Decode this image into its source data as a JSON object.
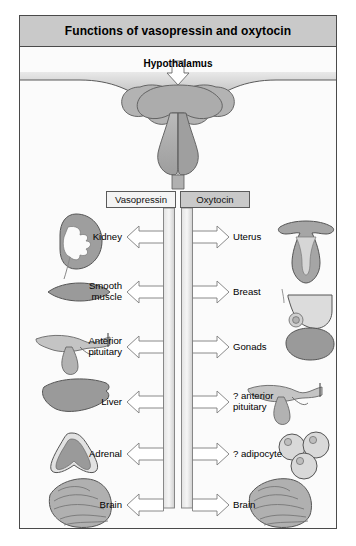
{
  "figure": {
    "title": "Functions of vasopressin and oxytocin",
    "source_label": "Hypothalamus"
  },
  "columns": {
    "left": {
      "header": "Vasopressin"
    },
    "right": {
      "header": "Oxytocin"
    }
  },
  "rows": [
    {
      "left_label": "Kidney",
      "right_label": "Uterus",
      "left_icon": "kidney-icon",
      "right_icon": "uterus-icon"
    },
    {
      "left_label": "Smooth\nmuscle",
      "left_label_line1": "Smooth",
      "left_label_line2": "muscle",
      "right_label": "Breast",
      "left_icon": "smooth-muscle-icon",
      "right_icon": "breast-icon"
    },
    {
      "left_label_line1": "Anterior",
      "left_label_line2": "pituitary",
      "right_label": "Gonads",
      "left_icon": "pituitary-icon",
      "right_icon": "gonads-icon"
    },
    {
      "left_label": "Liver",
      "right_label_line1": "? anterior",
      "right_label_line2": "pituitary",
      "left_icon": "liver-icon",
      "right_icon": "pituitary-icon"
    },
    {
      "left_label": "Adrenal",
      "right_label": "? adipocyte",
      "left_icon": "adrenal-icon",
      "right_icon": "adipocyte-icon"
    },
    {
      "left_label": "Brain",
      "right_label": "Brain",
      "left_icon": "brain-icon",
      "right_icon": "brain-icon"
    }
  ],
  "colors": {
    "header_bar": "#c9c9c9",
    "organ_fill": "#a8a8a8",
    "organ_fill_light": "#d2d2d2",
    "outline": "#4a4a4a",
    "arrow_fill": "#ffffff",
    "page_bg": "#fbfbfb"
  }
}
